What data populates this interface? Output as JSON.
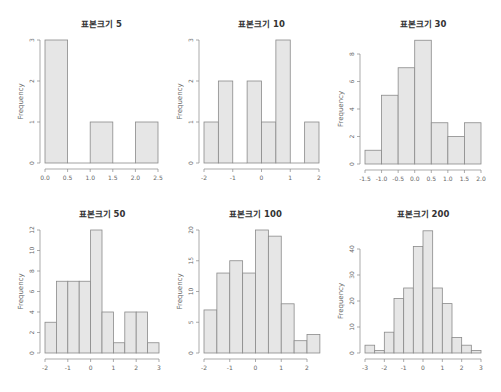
{
  "figure": {
    "colors": {
      "bar_fill": "#e6e6e6",
      "bar_stroke": "#8a8a8a",
      "axis": "#888888",
      "text": "#333333"
    }
  },
  "chart_data": [
    {
      "type": "bar",
      "title": "표본크기 5",
      "xlabel": "",
      "ylabel": "Frequency",
      "bin_edges": [
        0.0,
        0.5,
        1.0,
        1.5,
        2.0,
        2.5
      ],
      "values": [
        3,
        0,
        1,
        0,
        1
      ],
      "xticks": [
        0.0,
        0.5,
        1.0,
        1.5,
        2.0,
        2.5
      ],
      "xtick_labels": [
        "0.0",
        "0.5",
        "1.0",
        "1.5",
        "2.0",
        "2.5"
      ],
      "yticks": [
        0,
        1,
        2,
        3
      ],
      "ylim": [
        0,
        3
      ],
      "grid": false,
      "layout": {
        "x0px": 45,
        "x1px": 158,
        "xmin": 0.0,
        "xmax": 2.5,
        "ybase": 163,
        "ytop": 40,
        "yaxis_x": 40,
        "title_y": 27,
        "xaxis_y": 169
      }
    },
    {
      "type": "bar",
      "title": "표본크기 10",
      "xlabel": "",
      "ylabel": "Frequency",
      "bin_edges": [
        -2.0,
        -1.5,
        -1.0,
        -0.5,
        0.0,
        0.5,
        1.0,
        1.5,
        2.0
      ],
      "values": [
        1,
        2,
        0,
        2,
        1,
        3,
        0,
        1
      ],
      "xticks": [
        -2,
        -1,
        0,
        1,
        2
      ],
      "xtick_labels": [
        "-2",
        "-1",
        "0",
        "1",
        "2"
      ],
      "yticks": [
        0,
        1,
        2,
        3
      ],
      "ylim": [
        0,
        3
      ],
      "grid": false,
      "layout": {
        "x0px": 204,
        "x1px": 319,
        "xmin": -2.0,
        "xmax": 2.0,
        "ybase": 163,
        "ytop": 40,
        "yaxis_x": 199,
        "title_y": 27,
        "xaxis_y": 169
      }
    },
    {
      "type": "bar",
      "title": "표본크기 30",
      "xlabel": "",
      "ylabel": "Frequency",
      "bin_edges": [
        -1.5,
        -1.0,
        -0.5,
        0.0,
        0.5,
        1.0,
        1.5,
        2.0
      ],
      "values": [
        1,
        5,
        7,
        9,
        3,
        2,
        3
      ],
      "xticks": [
        -1.5,
        -1.0,
        -0.5,
        0.0,
        0.5,
        1.0,
        1.5,
        2.0
      ],
      "xtick_labels": [
        "-1.5",
        "-1.0",
        "-0.5",
        "0.0",
        "0.5",
        "1.0",
        "1.5",
        "2.0"
      ],
      "yticks": [
        0,
        2,
        4,
        6,
        8
      ],
      "ylim": [
        0,
        8
      ],
      "grid": false,
      "layout": {
        "x0px": 365,
        "x1px": 481,
        "xmin": -1.5,
        "xmax": 2.0,
        "ybase": 164,
        "ytop": 54,
        "yaxis_x": 360,
        "title_y": 27,
        "xaxis_y": 170
      }
    },
    {
      "type": "bar",
      "title": "표본크기 50",
      "xlabel": "",
      "ylabel": "Frequency",
      "bin_edges": [
        -2.0,
        -1.5,
        -1.0,
        -0.5,
        0.0,
        0.5,
        1.0,
        1.5,
        2.0,
        2.5,
        3.0
      ],
      "values": [
        3,
        7,
        7,
        7,
        12,
        4,
        1,
        4,
        4,
        1
      ],
      "xticks": [
        -2,
        -1,
        0,
        1,
        2,
        3
      ],
      "xtick_labels": [
        "-2",
        "-1",
        "0",
        "1",
        "2",
        "3"
      ],
      "yticks": [
        0,
        2,
        4,
        6,
        8,
        10,
        12
      ],
      "ylim": [
        0,
        12
      ],
      "grid": false,
      "layout": {
        "x0px": 45,
        "x1px": 159,
        "xmin": -2.0,
        "xmax": 3.0,
        "ybase": 353,
        "ytop": 230,
        "yaxis_x": 40,
        "title_y": 217,
        "xaxis_y": 359
      }
    },
    {
      "type": "bar",
      "title": "표본크기 100",
      "xlabel": "",
      "ylabel": "Frequency",
      "bin_edges": [
        -2.0,
        -1.5,
        -1.0,
        -0.5,
        0.0,
        0.5,
        1.0,
        1.5,
        2.0,
        2.5
      ],
      "values": [
        7,
        13,
        15,
        13,
        20,
        19,
        8,
        2,
        3
      ],
      "xticks": [
        -2,
        -1,
        0,
        1,
        2
      ],
      "xtick_labels": [
        "-2",
        "-1",
        "0",
        "1",
        "2"
      ],
      "yticks": [
        0,
        5,
        10,
        15,
        20
      ],
      "ylim": [
        0,
        20
      ],
      "grid": false,
      "layout": {
        "x0px": 204,
        "x1px": 307,
        "xmin": -2.0,
        "xmax": 2.0,
        "ybase": 353,
        "ytop": 230,
        "yaxis_x": 199,
        "title_y": 217,
        "xaxis_y": 359
      }
    },
    {
      "type": "bar",
      "title": "표본크기 200",
      "xlabel": "",
      "ylabel": "Frequency",
      "bin_edges": [
        -3.0,
        -2.5,
        -2.0,
        -1.5,
        -1.0,
        -0.5,
        0.0,
        0.5,
        1.0,
        1.5,
        2.0,
        2.5,
        3.0
      ],
      "values": [
        3,
        1,
        8,
        21,
        25,
        41,
        47,
        25,
        19,
        6,
        3,
        1
      ],
      "xticks": [
        -3,
        -2,
        -1,
        0,
        1,
        2,
        3
      ],
      "xtick_labels": [
        "-3",
        "-2",
        "-1",
        "0",
        "1",
        "2",
        "3"
      ],
      "yticks": [
        0,
        10,
        20,
        30,
        40
      ],
      "ylim": [
        0,
        47
      ],
      "grid": false,
      "layout": {
        "x0px": 365,
        "x1px": 481,
        "xmin": -3.0,
        "xmax": 3.0,
        "ybase": 353,
        "ytop": 249,
        "ytop_value": 40,
        "yaxis_x": 360,
        "title_y": 217,
        "xaxis_y": 359
      }
    }
  ]
}
